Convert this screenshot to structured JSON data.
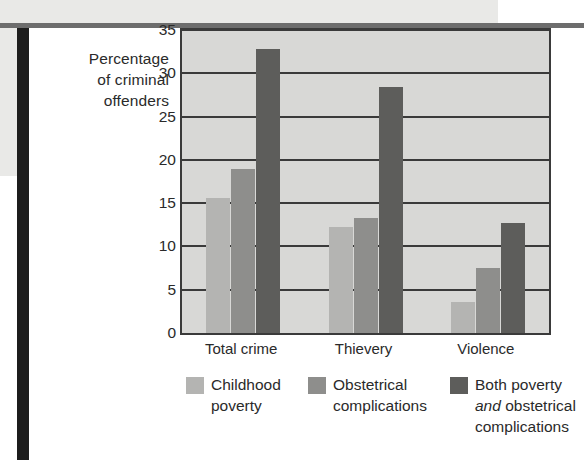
{
  "chart_data": {
    "type": "bar",
    "title": "",
    "subtitle": "",
    "xlabel": "",
    "ylabel": "Percentage of criminal offenders",
    "ylabel_lines": [
      "Percentage",
      "of criminal",
      "offenders"
    ],
    "categories": [
      "Total crime",
      "Thievery",
      "Violence"
    ],
    "series": [
      {
        "name": "Childhood poverty",
        "color": "#b4b4b2",
        "values": [
          15.6,
          12.2,
          3.6
        ]
      },
      {
        "name": "Obstetrical complications",
        "color": "#8e8e8c",
        "values": [
          18.9,
          13.3,
          7.5
        ]
      },
      {
        "name": "Both poverty and obstetrical complications",
        "color": "#5d5d5b",
        "values": [
          32.8,
          28.4,
          12.7
        ]
      }
    ],
    "ylim": [
      0,
      35
    ],
    "ytick_values": [
      0,
      5,
      10,
      15,
      20,
      25,
      30,
      35
    ],
    "ytick_labels": [
      "0",
      "5",
      "10",
      "15",
      "20",
      "25",
      "30",
      "35"
    ],
    "grid": true,
    "grid_axis": "y",
    "legend_position": "bottom",
    "plot_background": "#d8d8d6",
    "axis_color": "#3a3a3a"
  },
  "legend": {
    "items": [
      {
        "line1": "Childhood",
        "line2": "poverty",
        "line3": "",
        "italic_word": ""
      },
      {
        "line1": "Obstetrical",
        "line2": "complications",
        "line3": "",
        "italic_word": ""
      },
      {
        "line1": "Both poverty",
        "line2_italic": "and",
        "line2_rest": " obstetrical",
        "line3": "complications"
      }
    ]
  }
}
